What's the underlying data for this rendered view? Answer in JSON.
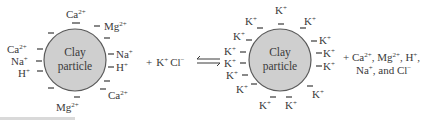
{
  "figure": {
    "left_particle": {
      "label_line1": "Clay",
      "label_line2": "particle",
      "ions": [
        {
          "base": "Ca",
          "charge": "2+"
        },
        {
          "base": "Mg",
          "charge": "2+"
        },
        {
          "base": "Na",
          "charge": "+"
        },
        {
          "base": "H",
          "charge": "+"
        },
        {
          "base": "Ca",
          "charge": "2+"
        },
        {
          "base": "Mg",
          "charge": "2+"
        },
        {
          "base": "Ca",
          "charge": "2+"
        },
        {
          "base": "Na",
          "charge": "+"
        },
        {
          "base": "H",
          "charge": "+"
        }
      ]
    },
    "reactant": {
      "plus": "+",
      "k_base": "K",
      "k_charge": "+",
      "cl_base": "Cl",
      "cl_charge": "−"
    },
    "equilibrium_arrow": "⇌",
    "right_particle": {
      "label_line1": "Clay",
      "label_line2": "particle",
      "ion_base": "K",
      "ion_charge": "+",
      "ion_count": 16
    },
    "products": {
      "line1": "+ Ca",
      "line1_c1": "2+",
      "line1_mid": ", Mg",
      "line1_c2": "2+",
      "line1_mid2": ", H",
      "line1_c3": "+",
      "line1_end": ",",
      "line2_a": "Na",
      "line2_c1": "+",
      "line2_b": ", and Cl",
      "line2_c2": "−"
    },
    "colors": {
      "particle_fill": "#cfcfcf",
      "particle_stroke": "#5a5a5a",
      "text": "#3a3a3a"
    }
  }
}
